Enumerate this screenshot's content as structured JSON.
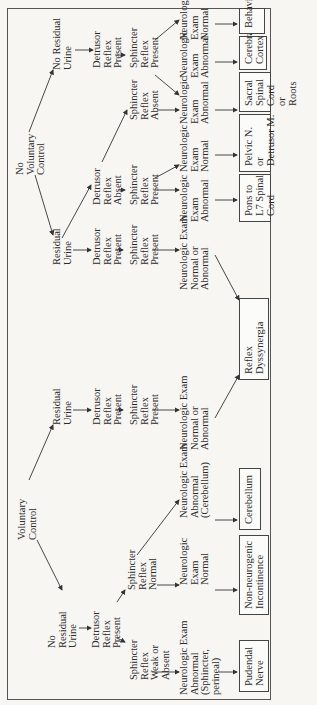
{
  "diagram": {
    "roots": {
      "voluntary": "Voluntary\nControl",
      "no_voluntary": "No\nVoluntary\nControl"
    },
    "voluntary_branch": {
      "no_residual": "No\nResidual\nUrine",
      "no_residual_detrusor": "Detrusor\nReflex\nPresent",
      "sphincter_weak": "Sphincter\nReflex\nWeak or\nAbsent",
      "sphincter_normal": "Sphincter\nReflex\nNormal",
      "neuro_abn_sphincter": "Neurologic Exam\nAbnormal\n(Sphincter,\nperineal)",
      "neuro_normal": "Neurologic\nExam\nNormal",
      "neuro_abn_cerebellum": "Neurologic Exam\nAbnormal\n(Cerebellum)",
      "residual": "Residual\nUrine",
      "residual_detrusor": "Detrusor\nReflex\nPresent",
      "residual_sphincter": "Sphincter\nReflex\nPresent",
      "residual_neuro": "Neurologic Exam\nNormal or\nAbnormal"
    },
    "no_voluntary_branch": {
      "residual": "Residual\nUrine",
      "detrusor_present": "Detrusor\nReflex\nPresent",
      "detrusor_present_sphincter": "Sphincter\nReflex\nPresent",
      "detrusor_present_neuro": "Neurologic Exam\nNormal or\nAbnormal",
      "detrusor_absent": "Detrusor\nReflex\nAbsent",
      "absent_sphincter_present": "Sphincter\nReflex\nPresent",
      "absent_neuro_abnormal": "Neurologic\nExam\nAbnormal",
      "absent_neuro_normal": "Neurologic\nExam\nNormal",
      "sphincter_absent": "Sphincter\nReflex\nAbsent",
      "sphincter_absent_neuro": "Neurologic\nExam\nAbnormal",
      "no_residual": "No Residual\nUrine",
      "no_residual_detrusor": "Detrusor\nReflex\nPresent",
      "no_residual_sphincter": "Sphincter\nReflex\nPresent",
      "nr_neuro_abnormal": "Neurologic\nExam\nAbnormal",
      "nr_neuro_normal": "Neurologic\nExam\nNormal"
    },
    "outcomes": {
      "pudendal": "Pudendal\nNerve",
      "non_neurogenic": "Non-neurogenic\nIncontinence",
      "cerebellum": "Cerebellum",
      "reflex_dyssynergia": "Reflex\nDyssynergia",
      "pons": "Pons to\nL7 Spinal\nCord",
      "pelvic": "Pelvic N.\nor\nDetrusor M.",
      "sacral": "Sacral\nSpinal\nCord\nor\nRoots",
      "cerebral": "Cerebral\nCortex",
      "behavior": "Behavior"
    }
  }
}
